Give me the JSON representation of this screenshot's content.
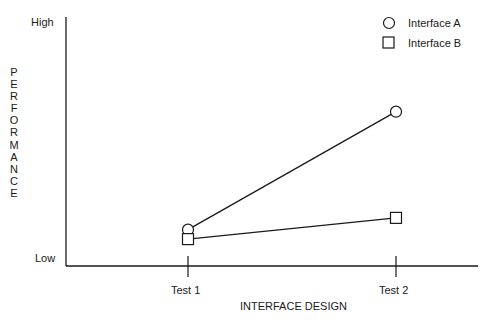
{
  "chart_data": {
    "type": "line",
    "title": "",
    "xlabel": "INTERFACE DESIGN",
    "ylabel": "PERFORMANCE",
    "categories": [
      "Test 1",
      "Test 2"
    ],
    "y_tick_labels": {
      "top": "High",
      "bottom": "Low"
    },
    "ylim": [
      0,
      10
    ],
    "grid": false,
    "legend_position": "top-right",
    "series": [
      {
        "name": "Interface A",
        "marker": "circle",
        "values": [
          1.2,
          6.2
        ]
      },
      {
        "name": "Interface B",
        "marker": "square",
        "values": [
          0.8,
          1.7
        ]
      }
    ]
  },
  "labels": {
    "high": "High",
    "low": "Low",
    "test1": "Test 1",
    "test2": "Test 2",
    "xaxis": "INTERFACE DESIGN",
    "yaxis_letters": [
      "P",
      "E",
      "R",
      "F",
      "O",
      "R",
      "M",
      "A",
      "N",
      "C",
      "E"
    ],
    "legend_a": "Interface A",
    "legend_b": "Interface B"
  }
}
